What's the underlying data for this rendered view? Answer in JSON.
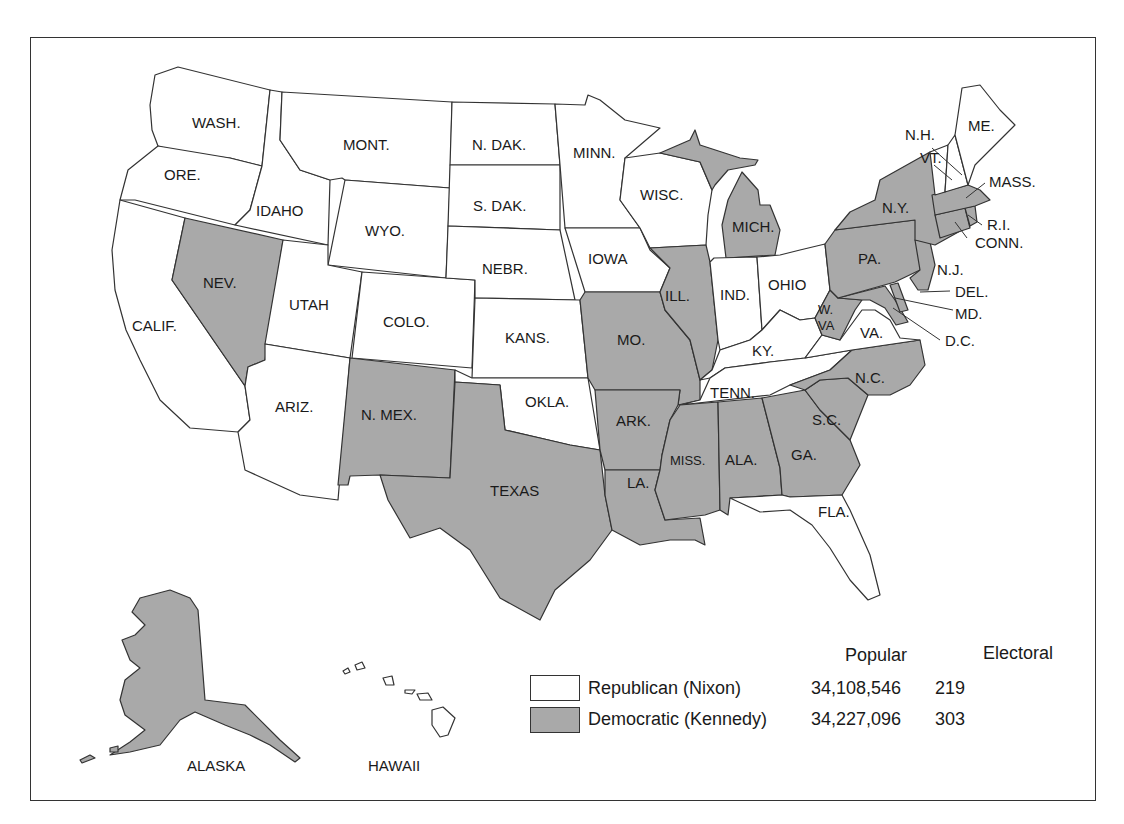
{
  "map": {
    "title": "1960 Presidential Election",
    "colors": {
      "republican": "#ffffff",
      "democratic": "#a9a9a9",
      "border": "#333333"
    },
    "states": {
      "WASH": {
        "label": "WASH.",
        "party": "republican"
      },
      "ORE": {
        "label": "ORE.",
        "party": "republican"
      },
      "CALIF": {
        "label": "CALIF.",
        "party": "republican"
      },
      "IDAHO": {
        "label": "IDAHO",
        "party": "republican"
      },
      "NEV": {
        "label": "NEV.",
        "party": "democratic"
      },
      "MONT": {
        "label": "MONT.",
        "party": "republican"
      },
      "WYO": {
        "label": "WYO.",
        "party": "republican"
      },
      "UTAH": {
        "label": "UTAH",
        "party": "republican"
      },
      "COLO": {
        "label": "COLO.",
        "party": "republican"
      },
      "ARIZ": {
        "label": "ARIZ.",
        "party": "republican"
      },
      "NMEX": {
        "label": "N. MEX.",
        "party": "democratic"
      },
      "NDAK": {
        "label": "N. DAK.",
        "party": "republican"
      },
      "SDAK": {
        "label": "S. DAK.",
        "party": "republican"
      },
      "NEBR": {
        "label": "NEBR.",
        "party": "republican"
      },
      "KANS": {
        "label": "KANS.",
        "party": "republican"
      },
      "OKLA": {
        "label": "OKLA.",
        "party": "republican"
      },
      "TEXAS": {
        "label": "TEXAS",
        "party": "democratic"
      },
      "MINN": {
        "label": "MINN.",
        "party": "republican"
      },
      "IOWA": {
        "label": "IOWA",
        "party": "republican"
      },
      "MO": {
        "label": "MO.",
        "party": "democratic"
      },
      "ARK": {
        "label": "ARK.",
        "party": "democratic"
      },
      "LA": {
        "label": "LA.",
        "party": "democratic"
      },
      "WISC": {
        "label": "WISC.",
        "party": "republican"
      },
      "ILL": {
        "label": "ILL.",
        "party": "democratic"
      },
      "MICH": {
        "label": "MICH.",
        "party": "democratic"
      },
      "IND": {
        "label": "IND.",
        "party": "republican"
      },
      "OHIO": {
        "label": "OHIO",
        "party": "republican"
      },
      "KY": {
        "label": "KY.",
        "party": "republican"
      },
      "TENN": {
        "label": "TENN.",
        "party": "republican"
      },
      "MISS": {
        "label": "MISS.",
        "party": "democratic"
      },
      "ALA": {
        "label": "ALA.",
        "party": "democratic"
      },
      "GA": {
        "label": "GA.",
        "party": "democratic"
      },
      "FLA": {
        "label": "FLA.",
        "party": "republican"
      },
      "SC": {
        "label": "S.C.",
        "party": "democratic"
      },
      "NC": {
        "label": "N.C.",
        "party": "democratic"
      },
      "VA": {
        "label": "VA.",
        "party": "republican"
      },
      "WVA1": {
        "label": "W.",
        "party": "democratic"
      },
      "WVA2": {
        "label": "VA",
        "party": "democratic"
      },
      "MD": {
        "label": "MD.",
        "party": "democratic"
      },
      "DEL": {
        "label": "DEL.",
        "party": "democratic"
      },
      "DC": {
        "label": "D.C.",
        "party": "democratic"
      },
      "PA": {
        "label": "PA.",
        "party": "democratic"
      },
      "NJ": {
        "label": "N.J.",
        "party": "democratic"
      },
      "NY": {
        "label": "N.Y.",
        "party": "democratic"
      },
      "CONN": {
        "label": "CONN.",
        "party": "democratic"
      },
      "RI": {
        "label": "R.I.",
        "party": "democratic"
      },
      "MASS": {
        "label": "MASS.",
        "party": "democratic"
      },
      "VT": {
        "label": "VT.",
        "party": "republican"
      },
      "NH": {
        "label": "N.H.",
        "party": "republican"
      },
      "ME": {
        "label": "ME.",
        "party": "republican"
      },
      "ALASKA": {
        "label": "ALASKA",
        "party": "democratic"
      },
      "HAWAII": {
        "label": "HAWAII",
        "party": "democratic"
      }
    }
  },
  "legend": {
    "columns": {
      "popular": "Popular",
      "electoral": "Electoral"
    },
    "rows": [
      {
        "label": "Republican (Nixon)",
        "popular": "34,108,546",
        "electoral": "219",
        "color": "#ffffff"
      },
      {
        "label": "Democratic (Kennedy)",
        "popular": "34,227,096",
        "electoral": "303",
        "color": "#a9a9a9"
      }
    ]
  }
}
